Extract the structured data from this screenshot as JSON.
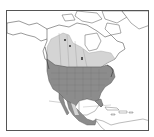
{
  "map": {
    "region": "North America",
    "colors": {
      "background": "#ffffff",
      "land": "#ffffff",
      "outline": "#555555",
      "range_primary": "#8c8c8c",
      "range_secondary": "#d4d4d4",
      "frame": "#555555"
    },
    "layers": [
      {
        "name": "range-primary",
        "description": "dark gray range covering contiguous United States and Mexico"
      },
      {
        "name": "range-secondary",
        "description": "light gray range covering southern/central Canada"
      }
    ]
  }
}
